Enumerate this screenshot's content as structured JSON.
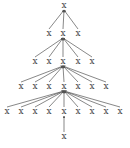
{
  "diagram": {
    "type": "tree",
    "label_glyph": "x",
    "colors": {
      "node": "#444444",
      "edge": "#555555",
      "background": "#ffffff"
    },
    "edge_style": "arrow-to-parent",
    "levels": [
      {
        "nodes": [
          {
            "x": 64
          }
        ],
        "y": 8
      },
      {
        "nodes": [
          {
            "x": 49
          },
          {
            "x": 63
          },
          {
            "x": 78
          }
        ],
        "y": 36
      },
      {
        "nodes": [
          {
            "x": 35
          },
          {
            "x": 49
          },
          {
            "x": 63
          },
          {
            "x": 78
          },
          {
            "x": 92
          }
        ],
        "y": 64
      },
      {
        "nodes": [
          {
            "x": 21
          },
          {
            "x": 35
          },
          {
            "x": 49
          },
          {
            "x": 64
          },
          {
            "x": 78
          },
          {
            "x": 92
          },
          {
            "x": 106
          }
        ],
        "y": 89
      },
      {
        "nodes": [
          {
            "x": 7
          },
          {
            "x": 21
          },
          {
            "x": 35
          },
          {
            "x": 49
          },
          {
            "x": 64
          },
          {
            "x": 78
          },
          {
            "x": 92
          },
          {
            "x": 106
          },
          {
            "x": 120
          }
        ],
        "y": 114
      },
      {
        "nodes": [
          {
            "x": 64
          }
        ],
        "y": 139
      }
    ],
    "parents": [
      {
        "level": 0,
        "index": 0
      },
      {
        "level": 1,
        "index": 1
      },
      {
        "level": 2,
        "index": 2
      },
      {
        "level": 3,
        "index": 3
      },
      {
        "level": 4,
        "index": 4
      }
    ]
  }
}
